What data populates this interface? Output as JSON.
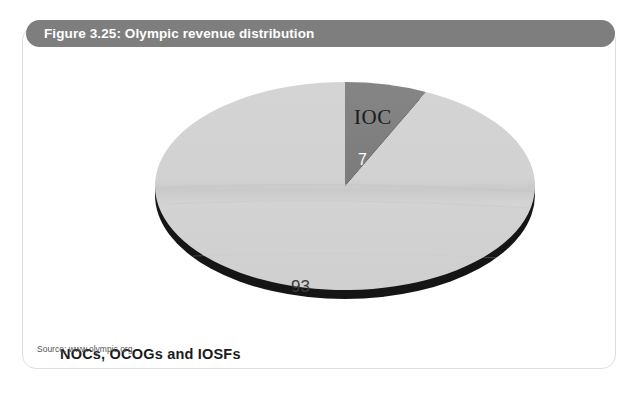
{
  "figure": {
    "title": "Figure 3.25: Olympic revenue distribution",
    "source": "Source: www.olympic.org",
    "title_bar_color": "#7e7e7e",
    "frame_border_color": "#dedede",
    "background_color": "#ffffff"
  },
  "chart_data": {
    "type": "pie",
    "title": "Figure 3.25: Olympic revenue distribution",
    "xlabel": "",
    "ylabel": "",
    "unit": "percent",
    "legend_position": "none",
    "grid": false,
    "three_d": true,
    "start_angle_deg": 0,
    "direction": "clockwise",
    "categories": [
      "IOC",
      "NOCs, OCOGs and IOSFs"
    ],
    "values": [
      7,
      93
    ],
    "labels": [
      "7",
      "93"
    ],
    "colors": [
      "#808080",
      "#d0d0d0"
    ],
    "slices": [
      {
        "name": "IOC",
        "value": 7,
        "value_label": "7",
        "category_label": "IOC",
        "color": "#808080",
        "value_label_color": "#ffffff",
        "category_label_color": "#1b1b1b",
        "start_angle_deg": 0,
        "sweep_deg": 25.2
      },
      {
        "name": "NOCs, OCOGs and IOSFs",
        "value": 93,
        "value_label": "93",
        "category_label": "NOCs, OCOGs and IOSFs",
        "color": "#d0d0d0",
        "value_label_color": "#3a3a3a",
        "category_label_color": "#1b1b1b",
        "start_angle_deg": 25.2,
        "sweep_deg": 334.8
      }
    ],
    "side_color": "#151515",
    "annotations": [
      {
        "text": "IOC",
        "position": "above-slice-1"
      },
      {
        "text": "7",
        "position": "inside-slice-1"
      },
      {
        "text": "93",
        "position": "inside-slice-2"
      },
      {
        "text": "NOCs, OCOGs and IOSFs",
        "position": "bottom-left"
      }
    ]
  }
}
